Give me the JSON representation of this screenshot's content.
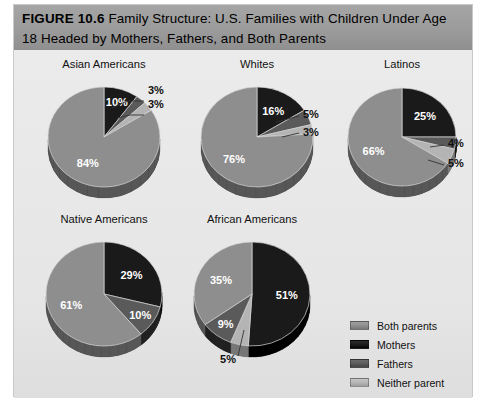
{
  "figure": {
    "number_label": "FIGURE 10.6",
    "title_line1": "Family Structure: U.S. Families with Children Under Age",
    "title_line2": "18 Headed by Mothers, Fathers, and Both Parents"
  },
  "colors": {
    "both_parents": "#8e8e8e",
    "mothers": "#1a1a1a",
    "fathers": "#5a5a5a",
    "neither_parent": "#b4b4b4",
    "header_bar": "#9a9a9a",
    "panel_background": "#e9e9e9"
  },
  "legend": {
    "items": [
      {
        "label": "Both parents",
        "color": "#8e8e8e"
      },
      {
        "label": "Mothers",
        "color": "#1a1a1a"
      },
      {
        "label": "Fathers",
        "color": "#5a5a5a"
      },
      {
        "label": "Neither parent",
        "color": "#b4b4b4"
      }
    ]
  },
  "chart_data": {
    "type": "pie",
    "title": "Family Structure: U.S. Families with Children Under Age 18 Headed by Mothers, Fathers, and Both Parents",
    "categories": [
      "Both parents",
      "Mothers",
      "Fathers",
      "Neither parent"
    ],
    "legend_position": "right",
    "value_unit": "percent",
    "charts": [
      {
        "title": "Asian Americans",
        "slices": [
          {
            "category": "Mothers",
            "value": 10,
            "label": "10%",
            "placement": "inside"
          },
          {
            "category": "Fathers",
            "value": 3,
            "label": "3%",
            "placement": "leader"
          },
          {
            "category": "Neither parent",
            "value": 3,
            "label": "3%",
            "placement": "leader"
          },
          {
            "category": "Both parents",
            "value": 84,
            "label": "84%",
            "placement": "inside"
          }
        ]
      },
      {
        "title": "Whites",
        "slices": [
          {
            "category": "Mothers",
            "value": 16,
            "label": "16%",
            "placement": "inside"
          },
          {
            "category": "Fathers",
            "value": 5,
            "label": "5%",
            "placement": "leader"
          },
          {
            "category": "Neither parent",
            "value": 3,
            "label": "3%",
            "placement": "leader"
          },
          {
            "category": "Both parents",
            "value": 76,
            "label": "76%",
            "placement": "inside"
          }
        ]
      },
      {
        "title": "Latinos",
        "slices": [
          {
            "category": "Mothers",
            "value": 25,
            "label": "25%",
            "placement": "inside"
          },
          {
            "category": "Fathers",
            "value": 4,
            "label": "4%",
            "placement": "leader"
          },
          {
            "category": "Neither parent",
            "value": 5,
            "label": "5%",
            "placement": "leader"
          },
          {
            "category": "Both parents",
            "value": 66,
            "label": "66%",
            "placement": "inside"
          }
        ]
      },
      {
        "title": "Native Americans",
        "slices": [
          {
            "category": "Mothers",
            "value": 29,
            "label": "29%",
            "placement": "inside"
          },
          {
            "category": "Fathers",
            "value": 10,
            "label": "10%",
            "placement": "inside"
          },
          {
            "category": "Both parents",
            "value": 61,
            "label": "61%",
            "placement": "inside"
          }
        ]
      },
      {
        "title": "African Americans",
        "slices": [
          {
            "category": "Mothers",
            "value": 51,
            "label": "51%",
            "placement": "inside"
          },
          {
            "category": "Neither parent",
            "value": 5,
            "label": "5%",
            "placement": "leader"
          },
          {
            "category": "Fathers",
            "value": 9,
            "label": "9%",
            "placement": "inside"
          },
          {
            "category": "Both parents",
            "value": 35,
            "label": "35%",
            "placement": "inside"
          }
        ]
      }
    ]
  }
}
